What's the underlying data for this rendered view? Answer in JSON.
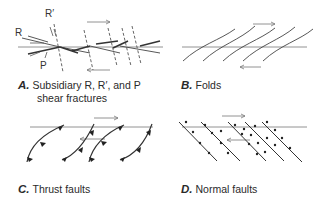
{
  "panels": [
    {
      "letter": "A.",
      "caption_line1": "Subsidiary R, R′, and P",
      "caption_line2": "shear fractures",
      "labels": {
        "r": "R",
        "r_prime": "R′",
        "p": "P"
      }
    },
    {
      "letter": "B.",
      "caption_line1": "Folds"
    },
    {
      "letter": "C.",
      "caption_line1": "Thrust faults"
    },
    {
      "letter": "D.",
      "caption_line1": "Normal faults"
    }
  ],
  "colors": {
    "line": "#555555",
    "heavy": "#333333",
    "arrow": "#666666"
  }
}
